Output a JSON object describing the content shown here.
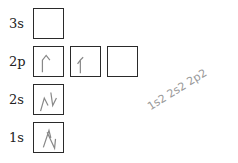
{
  "diagram": {
    "rows": [
      {
        "label": "3s",
        "boxes": [
          ""
        ]
      },
      {
        "label": "2p",
        "boxes": [
          "up",
          "up",
          ""
        ]
      },
      {
        "label": "2s",
        "boxes": [
          "up-down"
        ]
      },
      {
        "label": "1s",
        "boxes": [
          "up-down"
        ]
      }
    ],
    "annotation": "1s2 2s2 2p2",
    "colors": {
      "box_border": "#2a2a2a",
      "arrow": "#888888",
      "handwriting": "#999999"
    }
  }
}
